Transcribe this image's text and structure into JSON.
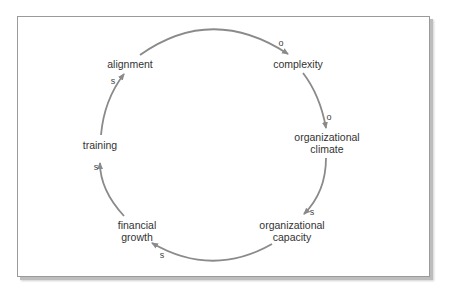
{
  "diagram": {
    "type": "causal-loop",
    "colors": {
      "arrow": "#8a8a8a",
      "text": "#333333",
      "frame": "#9a9a9a",
      "shadow": "#bdbdbd"
    },
    "nodes": [
      {
        "id": "complexity",
        "label": "complexity"
      },
      {
        "id": "climate",
        "label_line1": "organizational",
        "label_line2": "climate"
      },
      {
        "id": "capacity",
        "label_line1": "organizational",
        "label_line2": "capacity"
      },
      {
        "id": "financial",
        "label_line1": "financial",
        "label_line2": "growth"
      },
      {
        "id": "training",
        "label": "training"
      },
      {
        "id": "alignment",
        "label": "alignment"
      }
    ],
    "links": [
      {
        "from": "alignment",
        "to": "complexity",
        "polarity": "o"
      },
      {
        "from": "complexity",
        "to": "organizational climate",
        "polarity": "o"
      },
      {
        "from": "organizational climate",
        "to": "organizational capacity",
        "polarity": "s"
      },
      {
        "from": "organizational capacity",
        "to": "financial growth",
        "polarity": "s"
      },
      {
        "from": "financial growth",
        "to": "training",
        "polarity": "s"
      },
      {
        "from": "training",
        "to": "alignment",
        "polarity": "s"
      }
    ]
  }
}
